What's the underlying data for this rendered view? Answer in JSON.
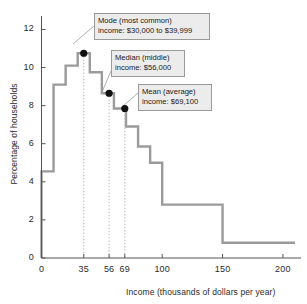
{
  "chart_data": {
    "type": "area",
    "title": "",
    "xlabel": "Income (thousands of dollars per year)",
    "ylabel": "Percentage of households",
    "xlim": [
      0,
      210
    ],
    "ylim": [
      0,
      12.6
    ],
    "grid": false,
    "legend": "none",
    "xticks": [
      "0",
      "35",
      "56",
      "69",
      "100",
      "150",
      "200"
    ],
    "xtick_values": [
      0,
      35,
      56,
      69,
      100,
      150,
      200
    ],
    "yticks": [
      "0",
      "2",
      "4",
      "6",
      "8",
      "10",
      "12"
    ],
    "ytick_values": [
      0,
      2,
      4,
      6,
      8,
      10,
      12
    ],
    "bins": [
      {
        "start": 0,
        "end": 10,
        "value": 4.55
      },
      {
        "start": 10,
        "end": 20,
        "value": 9.1
      },
      {
        "start": 20,
        "end": 30,
        "value": 10.1
      },
      {
        "start": 30,
        "end": 40,
        "value": 10.75
      },
      {
        "start": 40,
        "end": 50,
        "value": 9.75
      },
      {
        "start": 50,
        "end": 60,
        "value": 8.65
      },
      {
        "start": 60,
        "end": 70,
        "value": 7.85
      },
      {
        "start": 70,
        "end": 80,
        "value": 6.9
      },
      {
        "start": 80,
        "end": 90,
        "value": 5.85
      },
      {
        "start": 90,
        "end": 100,
        "value": 5.0
      },
      {
        "start": 100,
        "end": 150,
        "value": 2.8
      },
      {
        "start": 150,
        "end": 200,
        "value": 0.8
      }
    ],
    "markers": [
      {
        "id": "mode",
        "x": 35,
        "y": 10.75
      },
      {
        "id": "median",
        "x": 56,
        "y": 8.65
      },
      {
        "id": "mean",
        "x": 69,
        "y": 7.85
      }
    ],
    "annotations": [
      {
        "id": "mode",
        "line1": "Mode (most common)",
        "line2": "income: $30,000 to $39,999",
        "box": {
          "left": 94,
          "top": 13,
          "width": 116,
          "height": 27
        },
        "leader": {
          "x1": 94,
          "y1": 26,
          "x2": 73,
          "y2": 44
        }
      },
      {
        "id": "median",
        "line1": "Median (middle)",
        "line2": "income: $56,000",
        "box": {
          "left": 111,
          "top": 50,
          "width": 74,
          "height": 27
        },
        "leader": {
          "x1": 111,
          "y1": 71,
          "x2": 102,
          "y2": 92
        }
      },
      {
        "id": "mean",
        "line1": "Mean (average)",
        "line2": "income: $69,100",
        "box": {
          "left": 138,
          "top": 84,
          "width": 74,
          "height": 27
        },
        "leader": {
          "x1": 138,
          "y1": 93,
          "x2": 122,
          "y2": 107
        }
      }
    ],
    "colors": {
      "line": "#9b9b9b",
      "marker": "#111111",
      "axis": "#555555",
      "dropline": "#b8b8b8",
      "callout_fill": "#ececec",
      "callout_border": "#9a9a9a",
      "text": "#1f1f1f"
    }
  }
}
